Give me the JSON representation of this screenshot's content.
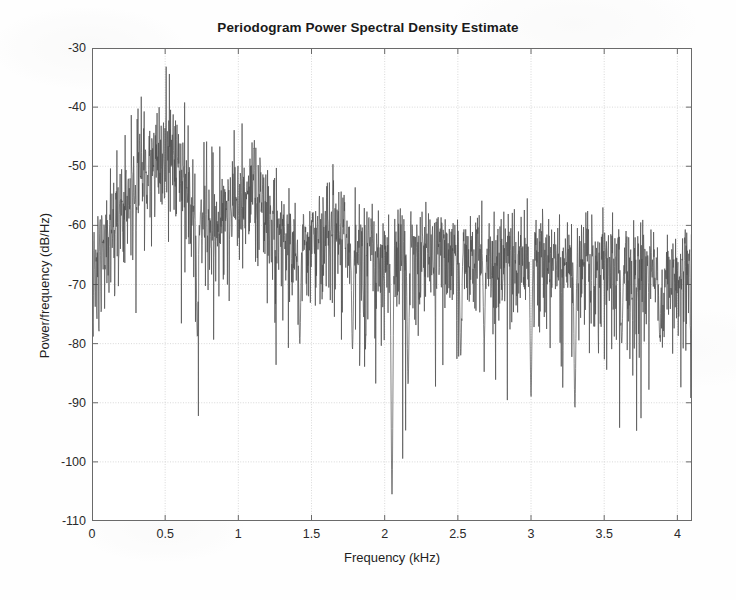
{
  "chart_data": {
    "type": "line",
    "title": "Periodogram Power Spectral Density Estimate",
    "xlabel": "Frequency (kHz)",
    "ylabel": "Power/frequency (dB/Hz)",
    "xlim": [
      0,
      4.1
    ],
    "ylim": [
      -110,
      -30
    ],
    "xticks": [
      0,
      0.5,
      1,
      1.5,
      2,
      2.5,
      3,
      3.5,
      4
    ],
    "xtick_labels": [
      "0",
      "0.5",
      "1",
      "1.5",
      "2",
      "2.5",
      "3",
      "3.5",
      "4"
    ],
    "yticks": [
      -110,
      -100,
      -90,
      -80,
      -70,
      -60,
      -50,
      -40,
      -30
    ],
    "ytick_labels": [
      "-110",
      "-100",
      "-90",
      "-80",
      "-70",
      "-60",
      "-50",
      "-40",
      "-30"
    ],
    "grid": true,
    "legend": null,
    "line_color": "#4d4d4d",
    "line_width": 0.7,
    "series": [
      {
        "name": "Periodogram PSD",
        "description": "Dense noisy power spectral density estimate of a speech-like signal; broadband noise floor decaying with frequency, strong low-frequency formant peaks near 0.2-0.6 kHz and 1.0-1.1 kHz, deep spectral nulls near 2.05, 3.0 and 3.3 kHz.",
        "envelope_x": [
          0.0,
          0.15,
          0.3,
          0.5,
          0.55,
          0.7,
          0.85,
          1.0,
          1.1,
          1.25,
          1.45,
          1.65,
          1.85,
          2.05,
          2.3,
          2.55,
          2.8,
          3.0,
          3.25,
          3.5,
          3.75,
          4.0,
          4.1
        ],
        "envelope_peak_db": [
          -62,
          -46,
          -39,
          -33,
          -31.2,
          -44,
          -47,
          -41,
          -37.5,
          -50,
          -52,
          -47,
          -55,
          -56,
          -55,
          -56,
          -54,
          -55,
          -57,
          -56,
          -59,
          -58,
          -60
        ],
        "envelope_mean_db": [
          -70,
          -58,
          -53,
          -47,
          -45,
          -57,
          -60,
          -54,
          -51,
          -61,
          -62,
          -59,
          -63,
          -64,
          -63,
          -64,
          -63,
          -64,
          -65,
          -65,
          -67,
          -67,
          -68
        ],
        "notches": [
          {
            "freq_khz": 0.72,
            "depth_db": -79
          },
          {
            "freq_khz": 1.42,
            "depth_db": -80
          },
          {
            "freq_khz": 1.78,
            "depth_db": -81
          },
          {
            "freq_khz": 2.05,
            "depth_db": -106
          },
          {
            "freq_khz": 2.16,
            "depth_db": -87
          },
          {
            "freq_khz": 2.52,
            "depth_db": -82
          },
          {
            "freq_khz": 2.68,
            "depth_db": -80
          },
          {
            "freq_khz": 3.0,
            "depth_db": -89
          },
          {
            "freq_khz": 3.3,
            "depth_db": -91
          },
          {
            "freq_khz": 3.62,
            "depth_db": -80
          },
          {
            "freq_khz": 3.88,
            "depth_db": -79
          }
        ],
        "max_db": -31.2,
        "min_db": -106,
        "n_points": 2048
      }
    ]
  }
}
